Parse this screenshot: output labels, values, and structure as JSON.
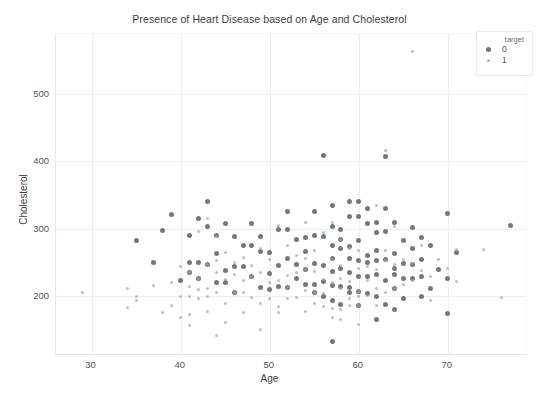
{
  "chart_data": {
    "type": "scatter",
    "title": "Presence of Heart Disease based on Age and Cholesterol",
    "xlabel": "Age",
    "ylabel": "Cholesterol",
    "xlim": [
      26,
      79
    ],
    "ylim": [
      110,
      590
    ],
    "xticks": [
      30,
      40,
      50,
      60,
      70
    ],
    "yticks": [
      200,
      300,
      400,
      500
    ],
    "grid": true,
    "legend": {
      "title": "target",
      "position": "upper right",
      "entries": [
        {
          "label": "0",
          "color": "#4d5666",
          "marker_size": 5
        },
        {
          "label": "1",
          "color": "#9aa4b4",
          "marker_size": 3
        }
      ]
    },
    "series": [
      {
        "name": "0",
        "color": "#4d5666",
        "points": [
          [
            35,
            282
          ],
          [
            37,
            250
          ],
          [
            38,
            297
          ],
          [
            39,
            321
          ],
          [
            40,
            223
          ],
          [
            41,
            250
          ],
          [
            41,
            289
          ],
          [
            42,
            226
          ],
          [
            42,
            315
          ],
          [
            43,
            247
          ],
          [
            43,
            341
          ],
          [
            44,
            263
          ],
          [
            44,
            290
          ],
          [
            45,
            308
          ],
          [
            45,
            219
          ],
          [
            46,
            204
          ],
          [
            46,
            243
          ],
          [
            47,
            243
          ],
          [
            47,
            275
          ],
          [
            48,
            229
          ],
          [
            48,
            275
          ],
          [
            49,
            212
          ],
          [
            49,
            266
          ],
          [
            50,
            233
          ],
          [
            50,
            264
          ],
          [
            51,
            213
          ],
          [
            51,
            298
          ],
          [
            52,
            212
          ],
          [
            52,
            255
          ],
          [
            52,
            298
          ],
          [
            53,
            226
          ],
          [
            53,
            246
          ],
          [
            54,
            217
          ],
          [
            54,
            239
          ],
          [
            54,
            266
          ],
          [
            55,
            217
          ],
          [
            55,
            248
          ],
          [
            55,
            289
          ],
          [
            56,
            245
          ],
          [
            56,
            288
          ],
          [
            56,
            409
          ],
          [
            57,
            131
          ],
          [
            57,
            192
          ],
          [
            57,
            236
          ],
          [
            57,
            256
          ],
          [
            57,
            274
          ],
          [
            57,
            303
          ],
          [
            58,
            213
          ],
          [
            58,
            240
          ],
          [
            58,
            270
          ],
          [
            58,
            284
          ],
          [
            59,
            212
          ],
          [
            59,
            234
          ],
          [
            59,
            255
          ],
          [
            59,
            273
          ],
          [
            59,
            318
          ],
          [
            60,
            206
          ],
          [
            60,
            229
          ],
          [
            60,
            253
          ],
          [
            60,
            282
          ],
          [
            60,
            318
          ],
          [
            61,
            203
          ],
          [
            61,
            228
          ],
          [
            61,
            260
          ],
          [
            61,
            307
          ],
          [
            62,
            164
          ],
          [
            62,
            199
          ],
          [
            62,
            231
          ],
          [
            62,
            267
          ],
          [
            62,
            294
          ],
          [
            63,
            187
          ],
          [
            63,
            223
          ],
          [
            63,
            254
          ],
          [
            63,
            330
          ],
          [
            63,
            407
          ],
          [
            64,
            211
          ],
          [
            64,
            240
          ],
          [
            64,
            263
          ],
          [
            64,
            309
          ],
          [
            65,
            225
          ],
          [
            65,
            248
          ],
          [
            65,
            282
          ],
          [
            66,
            226
          ],
          [
            66,
            246
          ],
          [
            66,
            271
          ],
          [
            67,
            229
          ],
          [
            67,
            254
          ],
          [
            67,
            286
          ],
          [
            68,
            211
          ],
          [
            68,
            274
          ],
          [
            69,
            239
          ],
          [
            70,
            174
          ],
          [
            70,
            225
          ],
          [
            70,
            322
          ],
          [
            71,
            265
          ],
          [
            77,
            304
          ],
          [
            45,
            237
          ],
          [
            51,
            245
          ],
          [
            54,
            286
          ],
          [
            56,
            221
          ],
          [
            58,
            299
          ],
          [
            60,
            185
          ],
          [
            62,
            309
          ],
          [
            64,
            180
          ],
          [
            66,
            302
          ],
          [
            41,
            235
          ],
          [
            43,
            303
          ],
          [
            48,
            308
          ],
          [
            52,
            325
          ],
          [
            55,
            325
          ],
          [
            57,
            335
          ],
          [
            59,
            341
          ],
          [
            61,
            330
          ],
          [
            63,
            295
          ],
          [
            65,
            195
          ],
          [
            44,
            219
          ],
          [
            46,
            288
          ],
          [
            49,
            288
          ],
          [
            53,
            283
          ],
          [
            58,
            187
          ],
          [
            60,
            340
          ],
          [
            62,
            252
          ],
          [
            67,
            199
          ],
          [
            42,
            249
          ],
          [
            50,
            209
          ],
          [
            55,
            205
          ],
          [
            56,
            198
          ],
          [
            57,
            215
          ],
          [
            59,
            204
          ],
          [
            61,
            249
          ],
          [
            64,
            231
          ]
        ]
      },
      {
        "name": "1",
        "color": "#9aa4b4",
        "points": [
          [
            29,
            204
          ],
          [
            34,
            210
          ],
          [
            34,
            182
          ],
          [
            35,
            198
          ],
          [
            37,
            215
          ],
          [
            38,
            175
          ],
          [
            39,
            219
          ],
          [
            40,
            167
          ],
          [
            40,
            199
          ],
          [
            41,
            172
          ],
          [
            41,
            198
          ],
          [
            41,
            214
          ],
          [
            41,
            235
          ],
          [
            42,
            196
          ],
          [
            42,
            209
          ],
          [
            42,
            295
          ],
          [
            43,
            177
          ],
          [
            43,
            211
          ],
          [
            43,
            247
          ],
          [
            43,
            315
          ],
          [
            44,
            204
          ],
          [
            44,
            235
          ],
          [
            44,
            288
          ],
          [
            45,
            224
          ],
          [
            45,
            264
          ],
          [
            46,
            231
          ],
          [
            46,
            249
          ],
          [
            47,
            204
          ],
          [
            47,
            257
          ],
          [
            48,
            197
          ],
          [
            48,
            245
          ],
          [
            49,
            188
          ],
          [
            49,
            234
          ],
          [
            50,
            219
          ],
          [
            50,
            254
          ],
          [
            51,
            175
          ],
          [
            51,
            222
          ],
          [
            51,
            305
          ],
          [
            52,
            196
          ],
          [
            52,
            230
          ],
          [
            53,
            197
          ],
          [
            53,
            234
          ],
          [
            54,
            177
          ],
          [
            54,
            208
          ],
          [
            54,
            239
          ],
          [
            54,
            309
          ],
          [
            55,
            204
          ],
          [
            55,
            268
          ],
          [
            56,
            184
          ],
          [
            56,
            224
          ],
          [
            56,
            294
          ],
          [
            57,
            168
          ],
          [
            57,
            220
          ],
          [
            57,
            254
          ],
          [
            57,
            309
          ],
          [
            58,
            179
          ],
          [
            58,
            211
          ],
          [
            58,
            245
          ],
          [
            58,
            283
          ],
          [
            59,
            195
          ],
          [
            59,
            221
          ],
          [
            59,
            270
          ],
          [
            60,
            198
          ],
          [
            60,
            206
          ],
          [
            60,
            240
          ],
          [
            60,
            268
          ],
          [
            61,
            200
          ],
          [
            61,
            243
          ],
          [
            62,
            210
          ],
          [
            62,
            239
          ],
          [
            62,
            335
          ],
          [
            63,
            204
          ],
          [
            63,
            252
          ],
          [
            63,
            417
          ],
          [
            64,
            246
          ],
          [
            64,
            303
          ],
          [
            65,
            254
          ],
          [
            66,
            248
          ],
          [
            66,
            564
          ],
          [
            67,
            237
          ],
          [
            68,
            193
          ],
          [
            69,
            254
          ],
          [
            70,
            241
          ],
          [
            71,
            221
          ],
          [
            71,
            269
          ],
          [
            74,
            269
          ],
          [
            76,
            197
          ],
          [
            35,
            192
          ],
          [
            39,
            185
          ],
          [
            44,
            141
          ],
          [
            45,
            160
          ],
          [
            47,
            175
          ],
          [
            49,
            149
          ],
          [
            51,
            184
          ],
          [
            53,
            260
          ],
          [
            55,
            236
          ],
          [
            57,
            181
          ],
          [
            59,
            186
          ],
          [
            61,
            222
          ],
          [
            63,
            268
          ],
          [
            65,
            217
          ],
          [
            42,
            226
          ],
          [
            46,
            204
          ],
          [
            50,
            196
          ],
          [
            52,
            212
          ],
          [
            56,
            203
          ],
          [
            58,
            225
          ],
          [
            60,
            185
          ],
          [
            64,
            210
          ],
          [
            48,
            229
          ],
          [
            54,
            255
          ],
          [
            62,
            186
          ],
          [
            40,
            243
          ],
          [
            43,
            199
          ],
          [
            45,
            188
          ],
          [
            47,
            222
          ],
          [
            52,
            274
          ],
          [
            55,
            188
          ],
          [
            67,
            275
          ],
          [
            58,
            164
          ],
          [
            60,
            157
          ],
          [
            41,
            156
          ],
          [
            66,
            223
          ],
          [
            68,
            229
          ],
          [
            44,
            252
          ],
          [
            49,
            271
          ]
        ]
      }
    ]
  }
}
